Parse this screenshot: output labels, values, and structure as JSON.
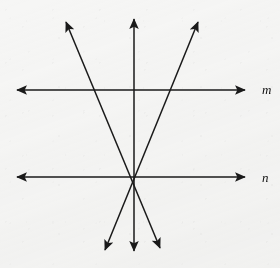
{
  "figure": {
    "kind": "geometry-diagram",
    "width": 280,
    "height": 268,
    "background_color": "#f6f6f5",
    "stroke_color": "#1a1a1a"
  },
  "labels": [
    {
      "id": "label-m",
      "text": "m",
      "x": 262,
      "y": 89
    },
    {
      "id": "label-n",
      "text": "n",
      "x": 262,
      "y": 177
    }
  ],
  "geometry": {
    "intersection_point": {
      "x": 133.5,
      "y": 177
    },
    "lines": [
      {
        "id": "line-m",
        "name": "horizontal-line-m",
        "label": "m",
        "orientation": "horizontal",
        "x1": 17,
        "y1": 90,
        "x2": 245,
        "y2": 90,
        "arrow_start": true,
        "arrow_end": true
      },
      {
        "id": "line-n",
        "name": "horizontal-line-n",
        "label": "n",
        "orientation": "horizontal",
        "x1": 17,
        "y1": 177,
        "x2": 245,
        "y2": 177,
        "arrow_start": true,
        "arrow_end": true
      },
      {
        "id": "transversal-vertical",
        "name": "vertical-transversal",
        "label": "",
        "orientation": "vertical",
        "x1": 134,
        "y1": 19,
        "x2": 134,
        "y2": 251,
        "arrow_start": true,
        "arrow_end": true
      },
      {
        "id": "transversal-ne-sw",
        "name": "transversal-northeast-southwest",
        "label": "",
        "orientation": "diagonal",
        "x1": 198,
        "y1": 22,
        "x2": 105,
        "y2": 250,
        "arrow_start": true,
        "arrow_end": true
      },
      {
        "id": "transversal-nw-se",
        "name": "transversal-northwest-southeast",
        "label": "",
        "orientation": "diagonal",
        "x1": 66,
        "y1": 22,
        "x2": 160,
        "y2": 248,
        "arrow_start": true,
        "arrow_end": true
      }
    ]
  }
}
